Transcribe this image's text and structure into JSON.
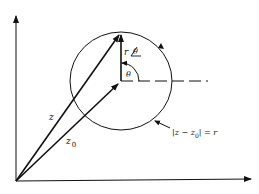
{
  "diagram": {
    "type": "complex-plane circle",
    "labels": {
      "z": "z",
      "z0_main": "z",
      "z0_sub": "0",
      "r_polar_r": "r",
      "r_polar_theta": "θ",
      "theta": "θ",
      "circle_eq_left": "|z − z",
      "circle_eq_sub": "0",
      "circle_eq_right": "| = r"
    },
    "colors": {
      "stroke": "#111111",
      "background": "#ffffff"
    }
  }
}
